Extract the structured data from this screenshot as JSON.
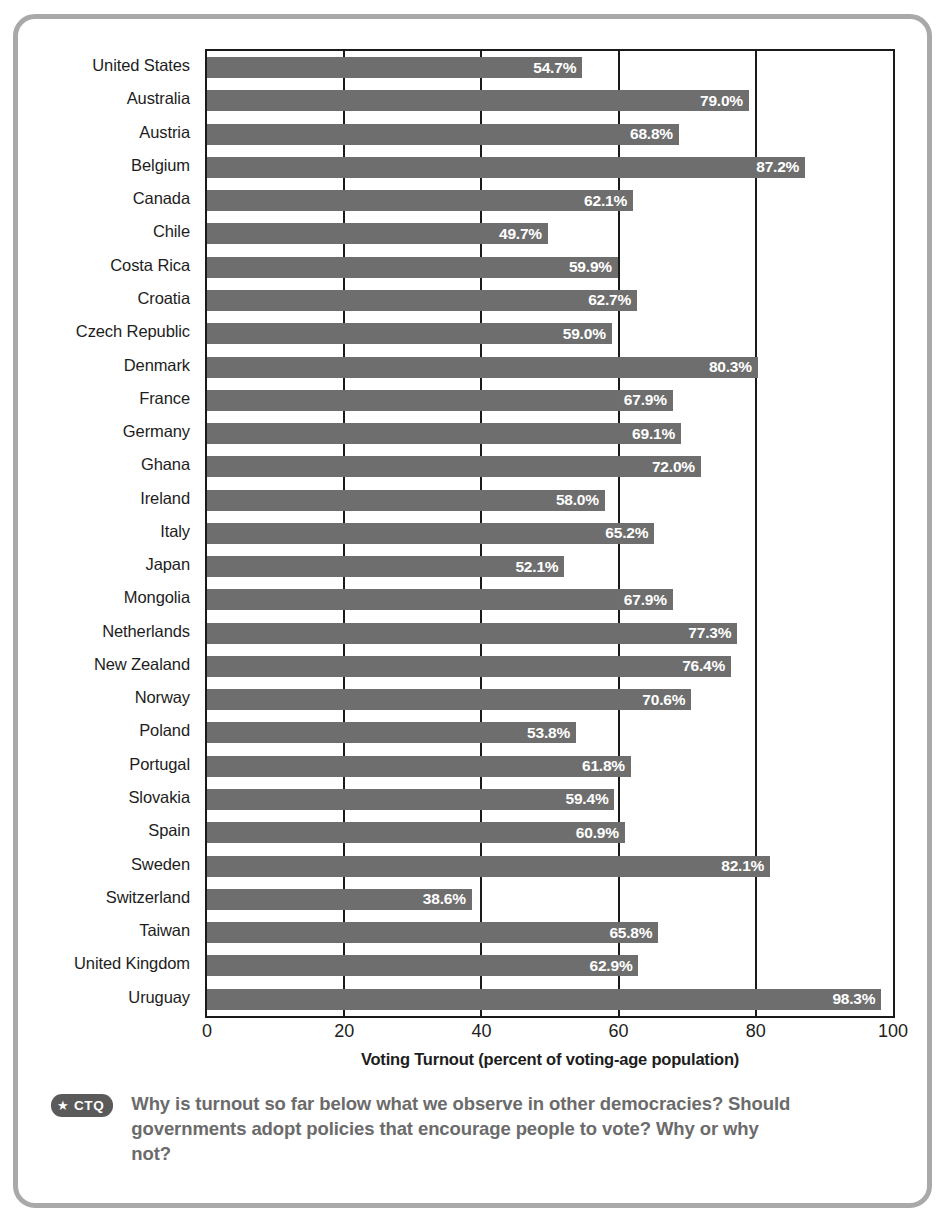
{
  "chart_data": {
    "type": "bar",
    "orientation": "horizontal",
    "title": "",
    "xlabel": "Voting Turnout (percent of voting-age population)",
    "ylabel": "",
    "xlim": [
      0,
      100
    ],
    "xticks": [
      "0",
      "20",
      "40",
      "60",
      "80",
      "100"
    ],
    "grid": true,
    "legend": null,
    "value_suffix": "%",
    "categories": [
      "United States",
      "Australia",
      "Austria",
      "Belgium",
      "Canada",
      "Chile",
      "Costa Rica",
      "Croatia",
      "Czech Republic",
      "Denmark",
      "France",
      "Germany",
      "Ghana",
      "Ireland",
      "Italy",
      "Japan",
      "Mongolia",
      "Netherlands",
      "New Zealand",
      "Norway",
      "Poland",
      "Portugal",
      "Slovakia",
      "Spain",
      "Sweden",
      "Switzerland",
      "Taiwan",
      "United Kingdom",
      "Uruguay"
    ],
    "values": [
      54.7,
      79.0,
      68.8,
      87.2,
      62.1,
      49.7,
      59.9,
      62.7,
      59.0,
      80.3,
      67.9,
      69.1,
      72.0,
      58.0,
      65.2,
      52.1,
      67.9,
      77.3,
      76.4,
      70.6,
      53.8,
      61.8,
      59.4,
      60.9,
      82.1,
      38.6,
      65.8,
      62.9,
      98.3
    ],
    "value_labels": [
      "54.7%",
      "79.0%",
      "68.8%",
      "87.2%",
      "62.1%",
      "49.7%",
      "59.9%",
      "62.7%",
      "59.0%",
      "80.3%",
      "67.9%",
      "69.1%",
      "72.0%",
      "58.0%",
      "65.2%",
      "52.1%",
      "67.9%",
      "77.3%",
      "76.4%",
      "70.6%",
      "53.8%",
      "61.8%",
      "59.4%",
      "60.9%",
      "82.1%",
      "38.6%",
      "65.8%",
      "62.9%",
      "98.3%"
    ],
    "colors": {
      "bar": "#6e6e6e",
      "axis": "#1a1a1a",
      "value_text": "#ffffff",
      "frame": "#a9a9a9",
      "caption_text": "#6b6b6b",
      "badge": "#5a5a5a"
    }
  },
  "caption": {
    "badge_star": "★",
    "badge_label": "CTQ",
    "text": "Why is turnout so far below what we observe in other democracies? Should governments adopt policies that encourage people to vote? Why or why not?"
  }
}
